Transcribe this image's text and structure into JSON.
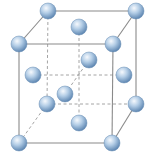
{
  "diagram": {
    "colors": {
      "edge": "#8a8a8a",
      "hidden_edge": "#9a9a9a",
      "atom_light": "#f4f8fc",
      "atom_mid": "#a9c6e2",
      "atom_dark": "#5f88b3"
    },
    "atom_radius": 8,
    "vertices": {
      "BTL": [
        48,
        11
      ],
      "BTR": [
        136,
        11
      ],
      "FTL": [
        19,
        44
      ],
      "FTR": [
        113,
        44
      ],
      "BBL": [
        47,
        104
      ],
      "BBR": [
        136,
        104
      ],
      "FBL": [
        19,
        143
      ],
      "FBR": [
        112,
        143
      ]
    },
    "solid_edges": [
      [
        "BTL",
        "BTR"
      ],
      [
        "FTL",
        "FTR"
      ],
      [
        "BTL",
        "FTL"
      ],
      [
        "BTR",
        "FTR"
      ],
      [
        "FTL",
        "FBL"
      ],
      [
        "FTR",
        "FBR"
      ],
      [
        "BTR",
        "BBR"
      ],
      [
        "FBL",
        "FBR"
      ],
      [
        "BBR",
        "FBR"
      ]
    ],
    "dashed_edges": [
      [
        "BTL",
        "BBL"
      ],
      [
        "BBL",
        "BBR"
      ],
      [
        "BBL",
        "FBL"
      ],
      [
        [
          79,
          27
        ],
        [
          79,
          123
        ]
      ],
      [
        [
          33,
          75
        ],
        [
          124,
          75
        ]
      ],
      [
        [
          65,
          94
        ],
        [
          89,
          60
        ]
      ]
    ],
    "atoms": [
      {
        "name": "corner-back-top-left",
        "pos": [
          48,
          11
        ]
      },
      {
        "name": "corner-back-top-right",
        "pos": [
          136,
          11
        ]
      },
      {
        "name": "face-top-center",
        "pos": [
          79,
          27
        ]
      },
      {
        "name": "corner-front-top-left",
        "pos": [
          19,
          44
        ]
      },
      {
        "name": "corner-front-top-right",
        "pos": [
          113,
          44
        ]
      },
      {
        "name": "face-back-center",
        "pos": [
          89,
          60
        ]
      },
      {
        "name": "face-left-center",
        "pos": [
          33,
          75
        ]
      },
      {
        "name": "face-right-center",
        "pos": [
          124,
          75
        ]
      },
      {
        "name": "corner-back-bottom-left",
        "pos": [
          47,
          104
        ]
      },
      {
        "name": "corner-back-bottom-right",
        "pos": [
          136,
          104
        ]
      },
      {
        "name": "face-front-center",
        "pos": [
          65,
          94
        ]
      },
      {
        "name": "face-bottom-center",
        "pos": [
          79,
          123
        ]
      },
      {
        "name": "corner-front-bottom-left",
        "pos": [
          19,
          143
        ]
      },
      {
        "name": "corner-front-bottom-right",
        "pos": [
          112,
          143
        ]
      }
    ]
  }
}
